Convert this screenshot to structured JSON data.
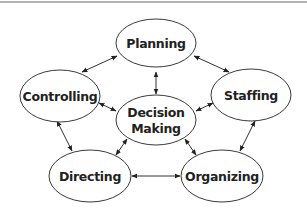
{
  "diagram": {
    "type": "cycle-network",
    "top_rule_color": "#9a9a9a",
    "nodes": [
      {
        "id": "planning",
        "label": "Planning",
        "cx": 156,
        "cy": 43,
        "rx": 40,
        "ry": 24
      },
      {
        "id": "controlling",
        "label": "Controlling",
        "cx": 60,
        "cy": 96,
        "rx": 40,
        "ry": 26
      },
      {
        "id": "staffing",
        "label": "Staffing",
        "cx": 251,
        "cy": 95,
        "rx": 40,
        "ry": 26
      },
      {
        "id": "decision_making",
        "label_line1": "Decision",
        "label_line2": "Making",
        "cx": 156,
        "cy": 120,
        "rx": 40,
        "ry": 25
      },
      {
        "id": "directing",
        "label": "Directing",
        "cx": 90,
        "cy": 176,
        "rx": 41,
        "ry": 26
      },
      {
        "id": "organizing",
        "label": "Organizing",
        "cx": 222,
        "cy": 176,
        "rx": 41,
        "ry": 26
      }
    ],
    "edges": [
      {
        "from": "controlling",
        "to": "planning",
        "bidirectional": true
      },
      {
        "from": "planning",
        "to": "staffing",
        "bidirectional": true
      },
      {
        "from": "planning",
        "to": "decision_making",
        "bidirectional": true
      },
      {
        "from": "controlling",
        "to": "decision_making",
        "bidirectional": true
      },
      {
        "from": "staffing",
        "to": "decision_making",
        "bidirectional": true
      },
      {
        "from": "controlling",
        "to": "directing",
        "bidirectional": true
      },
      {
        "from": "staffing",
        "to": "organizing",
        "bidirectional": true
      },
      {
        "from": "decision_making",
        "to": "directing",
        "bidirectional": true
      },
      {
        "from": "decision_making",
        "to": "organizing",
        "bidirectional": true
      },
      {
        "from": "directing",
        "to": "organizing",
        "bidirectional": true
      }
    ]
  }
}
